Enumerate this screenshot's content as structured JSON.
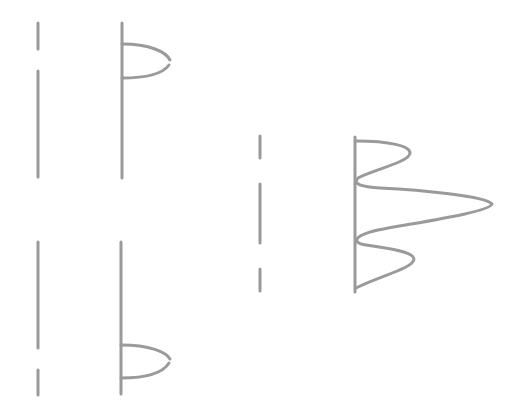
{
  "figure": {
    "width": 523,
    "height": 419,
    "background": "#ffffff",
    "stroke_color": "#9a9a9a",
    "stroke_width": 3,
    "panels": [
      {
        "name": "single-slit-top",
        "barrier": {
          "x": 38,
          "segments": [
            [
              23,
              49
            ],
            [
              71,
              177
            ]
          ]
        },
        "screen": {
          "x": 122,
          "y1": 23,
          "y2": 178
        },
        "pattern_path": "M122,44 C150,44 166,52 170,60 M169,65 C164,72 150,78 122,78"
      },
      {
        "name": "single-slit-bottom",
        "barrier": {
          "x": 38,
          "segments": [
            [
              242,
              348
            ],
            [
              370,
              395
            ]
          ]
        },
        "screen": {
          "x": 121,
          "y1": 242,
          "y2": 394
        },
        "pattern_path": "M121,345 C150,345 166,352 170,359 M169,363 C164,371 150,378 121,378"
      },
      {
        "name": "double-slit",
        "barrier": {
          "x": 260,
          "segments": [
            [
              136,
              158
            ],
            [
              184,
              243
            ],
            [
              269,
              291
            ]
          ]
        },
        "screen": {
          "x": 355,
          "y1": 137,
          "y2": 292
        },
        "pattern_path": "M356,141 C390,141 410,146 410,153 C410,162 372,170 358,178 C352,184 362,187 380,188 C420,190 486,196 492,204 C490,212 420,222 378,230 C352,236 352,243 366,245 C388,248 414,252 414,259 C414,268 380,276 356,288"
      }
    ]
  }
}
